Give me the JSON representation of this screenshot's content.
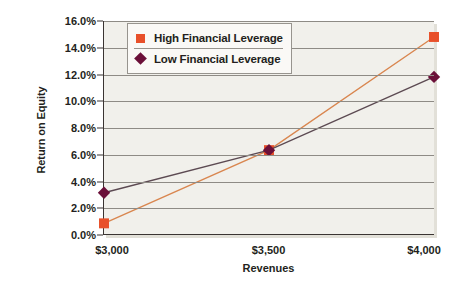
{
  "chart_data": {
    "type": "line",
    "title": "",
    "xlabel": "Revenues",
    "ylabel": "Return on Equity",
    "x": [
      3000,
      3500,
      4000
    ],
    "categories": [
      "$3,000",
      "$3,500",
      "$4,000"
    ],
    "xticklabels": [
      "$3,000",
      "$3,500",
      "$4,000"
    ],
    "yticklabels": [
      "0.0%",
      "2.0%",
      "4.0%",
      "6.0%",
      "8.0%",
      "10.0%",
      "12.0%",
      "14.0%",
      "16.0%"
    ],
    "ytickvalues": [
      0,
      2,
      4,
      6,
      8,
      10,
      12,
      14,
      16
    ],
    "ylim": [
      0,
      16
    ],
    "xlim": [
      3000,
      4000
    ],
    "grid": "horizontal",
    "legend_position": "upper-left-inside",
    "series": [
      {
        "name": "High Financial Leverage",
        "marker": "square",
        "color": "#e8502a",
        "line_color": "#d9864f",
        "values": [
          0.8,
          6.3,
          14.8
        ]
      },
      {
        "name": "Low Financial Leverage",
        "marker": "diamond",
        "color": "#6b1039",
        "line_color": "#5c4a52",
        "values": [
          3.1,
          6.3,
          11.8
        ]
      }
    ]
  },
  "axes": {
    "y_title": "Return on Equity",
    "x_title": "Revenues"
  },
  "legend": {
    "items": [
      {
        "label": "High Financial Leverage",
        "marker": "square-marker-icon",
        "color": "#e8502a"
      },
      {
        "label": "Low Financial Leverage",
        "marker": "diamond-marker-icon",
        "color": "#6b1039"
      }
    ]
  },
  "colors": {
    "plot_background": "#f1f0eb",
    "page_background": "#ffffff",
    "axis": "#3a3432",
    "gridline": "#8e8b85",
    "high_leverage": "#e8502a",
    "low_leverage": "#6b1039"
  }
}
